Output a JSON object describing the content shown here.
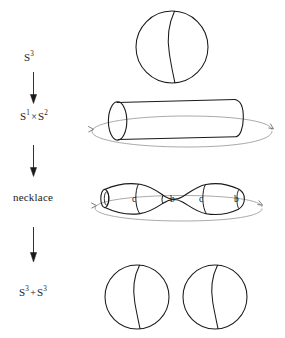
{
  "figure": {
    "background_color": "#ffffff",
    "ink_color": "#1a1a1a",
    "faint_ink_color": "#8a8a8a",
    "width": 285,
    "height": 338
  },
  "stages": [
    {
      "id": "stage-s3",
      "label_base": "S",
      "label_exponent": "3",
      "label_text": "S3",
      "shape": "sphere-with-arc"
    },
    {
      "id": "stage-s1xs2",
      "label_base": "S",
      "label_exponent": "1",
      "label_operator": "×",
      "label_base2": "S",
      "label_exponent2": "2",
      "label_text": "S1 x S2",
      "shape": "cylinder-with-identification-loop"
    },
    {
      "id": "stage-necklace",
      "label_text": "necklace",
      "shape": "necklace-with-identification-loop"
    },
    {
      "id": "stage-s3-plus-s3",
      "label_base": "S",
      "label_exponent": "3",
      "label_operator": "+",
      "label_base2": "S",
      "label_exponent2": "3",
      "label_text": "S3 + S3",
      "shape": "two-spheres-with-arcs"
    }
  ],
  "arrows": [
    {
      "id": "arrow-1",
      "direction": "down"
    },
    {
      "id": "arrow-2",
      "direction": "down"
    },
    {
      "id": "arrow-3",
      "direction": "down"
    }
  ],
  "necklace_beads": [
    {
      "id": "bead-label-1",
      "text": "c"
    },
    {
      "id": "bead-label-2",
      "text": "b"
    },
    {
      "id": "bead-label-3",
      "text": "c"
    },
    {
      "id": "bead-label-4",
      "text": "b"
    }
  ]
}
